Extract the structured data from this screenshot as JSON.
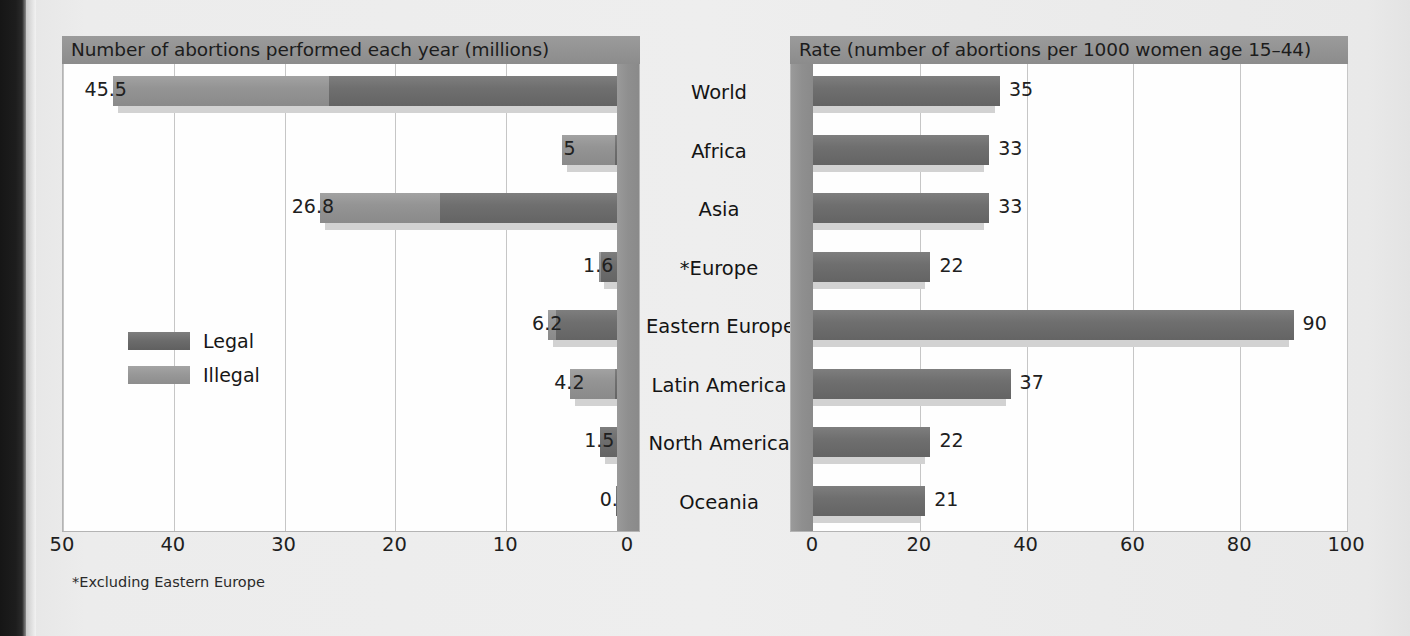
{
  "figure": {
    "footnote": "*Excluding Eastern Europe"
  },
  "left_panel": {
    "title": "Number of abortions performed each year (millions)",
    "axis_ticks": [
      "50",
      "40",
      "30",
      "20",
      "10",
      "0"
    ]
  },
  "right_panel": {
    "title": "Rate (number of abortions per 1000 women age 15–44)",
    "axis_ticks": [
      "0",
      "20",
      "40",
      "60",
      "80",
      "100"
    ]
  },
  "legend": {
    "items": [
      {
        "label": "Legal",
        "color": "#6b6b6b"
      },
      {
        "label": "Illegal",
        "color": "#979797"
      }
    ]
  },
  "categories": [
    "World",
    "Africa",
    "Asia",
    "*Europe",
    "Eastern Europe",
    "Latin America",
    "North America",
    "Oceania"
  ],
  "left_labels": [
    "45.5",
    "5",
    "26.8",
    "1.6",
    "6.2",
    "4.2",
    "1.5",
    "0.1"
  ],
  "right_labels": [
    "35",
    "33",
    "33",
    "22",
    "90",
    "37",
    "22",
    "21"
  ],
  "chart_data": [
    {
      "type": "bar",
      "title": "Number of abortions performed each year (millions)",
      "orientation": "horizontal",
      "direction": "right-to-left",
      "stacked": true,
      "xlabel": "",
      "ylabel": "",
      "xlim": [
        0,
        50
      ],
      "xticks": [
        50,
        40,
        30,
        20,
        10,
        0
      ],
      "grid": true,
      "legend_position": "inside-left",
      "categories": [
        "World",
        "Africa",
        "Asia",
        "*Europe",
        "Eastern Europe",
        "Latin America",
        "North America",
        "Oceania"
      ],
      "totals": [
        45.5,
        5,
        26.8,
        1.6,
        6.2,
        4.2,
        1.5,
        0.1
      ],
      "series": [
        {
          "name": "Legal",
          "values": [
            26.0,
            0.2,
            16.0,
            1.4,
            5.5,
            0.2,
            1.5,
            0.1
          ]
        },
        {
          "name": "Illegal",
          "values": [
            19.5,
            4.8,
            10.8,
            0.2,
            0.7,
            4.0,
            0.0,
            0.0
          ]
        }
      ]
    },
    {
      "type": "bar",
      "title": "Rate (number of abortions per 1000 women age 15–44)",
      "orientation": "horizontal",
      "direction": "left-to-right",
      "stacked": false,
      "xlabel": "",
      "ylabel": "",
      "xlim": [
        0,
        100
      ],
      "xticks": [
        0,
        20,
        40,
        60,
        80,
        100
      ],
      "grid": true,
      "categories": [
        "World",
        "Africa",
        "Asia",
        "*Europe",
        "Eastern Europe",
        "Latin America",
        "North America",
        "Oceania"
      ],
      "series": [
        {
          "name": "Rate",
          "values": [
            35,
            33,
            33,
            22,
            90,
            37,
            22,
            21
          ]
        }
      ]
    }
  ]
}
